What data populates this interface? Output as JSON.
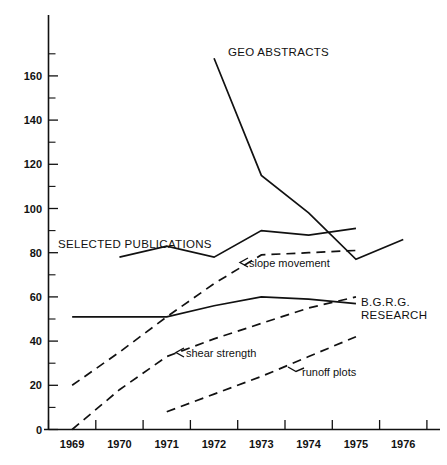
{
  "chart_data": {
    "type": "line",
    "title": "",
    "subtitle": "",
    "xlabel": "",
    "ylabel": "",
    "x": [
      1969,
      1970,
      1971,
      1972,
      1973,
      1974,
      1975,
      1976
    ],
    "xtick_labels": [
      "1969",
      "1970",
      "1971",
      "1972",
      "1973",
      "1974",
      "1975",
      "1976"
    ],
    "xlim": [
      1968.5,
      1976.5
    ],
    "ylim": [
      0,
      170
    ],
    "ytick_values": [
      0,
      20,
      40,
      60,
      80,
      100,
      120,
      140,
      160
    ],
    "ytick_labels": [
      "0",
      "20",
      "40",
      "60",
      "80",
      "100",
      "120",
      "140",
      "160"
    ],
    "yminor_tick_values": [
      10,
      30,
      50,
      70,
      90,
      110,
      130,
      150,
      170
    ],
    "grid": false,
    "legend": "inline-annotations",
    "series": [
      {
        "name": "GEO ABSTRACTS",
        "style": "solid",
        "label": "GEO ABSTRACTS",
        "x": [
          1972,
          1973,
          1974,
          1975,
          1976
        ],
        "values": [
          168,
          115,
          98,
          77,
          86
        ]
      },
      {
        "name": "SELECTED PUBLICATIONS",
        "style": "solid",
        "label": "SELECTED PUBLICATIONS",
        "x": [
          1970,
          1971,
          1972,
          1973,
          1974,
          1975
        ],
        "values": [
          78,
          83,
          78,
          90,
          88,
          91
        ]
      },
      {
        "name": "B.G.R.G. RESEARCH",
        "style": "solid",
        "label": "B.G.R.G. RESEARCH",
        "x": [
          1969,
          1970,
          1971,
          1972,
          1973,
          1974,
          1975
        ],
        "values": [
          51,
          51,
          51,
          56,
          60,
          59,
          57
        ]
      },
      {
        "name": "slope movement",
        "style": "dashed",
        "label": "slope movement",
        "x": [
          1969,
          1970,
          1971,
          1972,
          1973,
          1974,
          1975
        ],
        "values": [
          20,
          35,
          51,
          66,
          79,
          80,
          81
        ]
      },
      {
        "name": "shear strength",
        "style": "dashed",
        "label": "shear strength",
        "x": [
          1969,
          1970,
          1971,
          1972,
          1973,
          1974,
          1975
        ],
        "values": [
          0,
          18,
          33,
          41,
          48,
          55,
          60
        ]
      },
      {
        "name": "runoff plots",
        "style": "dashed",
        "label": "runoff plots",
        "x": [
          1971,
          1972,
          1973,
          1974,
          1975
        ],
        "values": [
          8,
          16,
          24,
          33,
          42
        ]
      }
    ],
    "annotations": [
      {
        "id": "geo-abstracts",
        "text": "GEO ABSTRACTS",
        "case": "upper",
        "leader": false
      },
      {
        "id": "selected-publications",
        "text": "SELECTED PUBLICATIONS",
        "case": "upper",
        "leader": false
      },
      {
        "id": "bgrg-research-line1",
        "text": "B.G.R.G.",
        "case": "upper",
        "leader": false
      },
      {
        "id": "bgrg-research-line2",
        "text": "RESEARCH",
        "case": "upper",
        "leader": false
      },
      {
        "id": "slope-movement",
        "text": "slope movement",
        "case": "lower",
        "leader": true
      },
      {
        "id": "shear-strength",
        "text": "shear  strength",
        "case": "lower",
        "leader": true
      },
      {
        "id": "runoff-plots",
        "text": "runoff plots",
        "case": "lower",
        "leader": true
      }
    ],
    "colors": {
      "ink": "#111111",
      "background": "#ffffff"
    }
  }
}
